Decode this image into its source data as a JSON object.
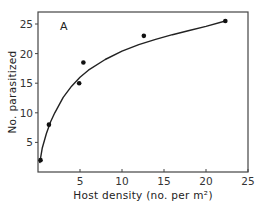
{
  "chart_data": {
    "type": "scatter",
    "title": "",
    "panel_label": "A",
    "xlabel": "Host density (no. per m²)",
    "ylabel": "No. parasitized",
    "xlim": [
      0,
      25
    ],
    "ylim": [
      0,
      27
    ],
    "xticks": [
      5,
      10,
      15,
      20,
      25
    ],
    "yticks": [
      5,
      10,
      15,
      20,
      25
    ],
    "grid": false,
    "legend": null,
    "series": [
      {
        "name": "observed",
        "kind": "points",
        "x": [
          0.3,
          1.3,
          4.9,
          5.4,
          12.6,
          22.3
        ],
        "y": [
          2,
          8,
          15,
          18.5,
          23,
          25.5
        ]
      },
      {
        "name": "fitted curve",
        "kind": "line",
        "x": [
          0.2,
          0.5,
          1,
          1.5,
          2,
          3,
          4,
          5,
          6,
          8,
          10,
          12,
          14,
          16,
          18,
          20,
          22.3
        ],
        "y": [
          1.5,
          4,
          6.5,
          8.5,
          10,
          12.6,
          14.5,
          16,
          17.2,
          19,
          20.4,
          21.5,
          22.4,
          23.2,
          23.9,
          24.6,
          25.5
        ]
      }
    ]
  }
}
